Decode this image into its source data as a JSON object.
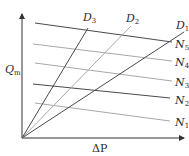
{
  "diagram": {
    "title": "",
    "axes": {
      "y_label": "Q",
      "y_label_sub": "m",
      "x_label": "ΔP"
    },
    "colors": {
      "dark": "#4a4a4a",
      "light": "#a8a8a8",
      "axis": "#333333"
    },
    "origin": [
      22,
      138
    ],
    "d_lines": [
      {
        "name": "D",
        "sub": "3",
        "end": [
          88,
          28
        ],
        "shade": "dark",
        "label_pos": [
          83,
          21
        ]
      },
      {
        "name": "D",
        "sub": "2",
        "end": [
          131,
          26
        ],
        "shade": "light",
        "label_pos": [
          126,
          22
        ]
      },
      {
        "name": "D",
        "sub": "1",
        "end": [
          184,
          32
        ],
        "shade": "dark",
        "label_pos": [
          176,
          29
        ]
      }
    ],
    "n_lines": [
      {
        "name": "N",
        "sub": "5",
        "start": [
          35,
          23
        ],
        "end": [
          172,
          42
        ],
        "shade": "dark",
        "label_pos": [
          175,
          48
        ]
      },
      {
        "name": "N",
        "sub": "4",
        "start": [
          33,
          44
        ],
        "end": [
          172,
          61
        ],
        "shade": "light",
        "label_pos": [
          175,
          66
        ]
      },
      {
        "name": "N",
        "sub": "3",
        "start": [
          35,
          63
        ],
        "end": [
          172,
          81
        ],
        "shade": "light",
        "label_pos": [
          175,
          86
        ]
      },
      {
        "name": "N",
        "sub": "2",
        "start": [
          33,
          84
        ],
        "end": [
          170,
          98
        ],
        "shade": "dark",
        "label_pos": [
          175,
          104
        ]
      },
      {
        "name": "N",
        "sub": "1",
        "start": [
          35,
          103
        ],
        "end": [
          170,
          121
        ],
        "shade": "light",
        "label_pos": [
          175,
          126
        ]
      }
    ]
  }
}
